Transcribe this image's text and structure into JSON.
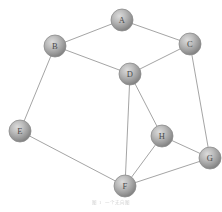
{
  "figure": {
    "caption": "图 1 一个无向图",
    "caption_legible": false,
    "caption_y": 199,
    "background_color": "#ffffff",
    "width": 222,
    "height": 212
  },
  "style": {
    "node_radius": 11,
    "node_fill_light": "#d2d2d2",
    "node_fill_mid": "#a6a6a6",
    "node_fill_dark": "#7d7d7d",
    "node_stroke": "#8c8c8c",
    "edge_color": "#9a9a9a",
    "edge_width": 0.9,
    "label_color": "#4a4a4a"
  },
  "chart_data": {
    "type": "diagram",
    "diagram_kind": "undirected-graph",
    "node_count": 8,
    "edge_count": 12,
    "nodes": [
      {
        "id": "A",
        "label": "A",
        "x": 122,
        "y": 20
      },
      {
        "id": "B",
        "label": "B",
        "x": 55,
        "y": 46
      },
      {
        "id": "C",
        "label": "C",
        "x": 190,
        "y": 44
      },
      {
        "id": "D",
        "label": "D",
        "x": 130,
        "y": 74
      },
      {
        "id": "E",
        "label": "E",
        "x": 20,
        "y": 131
      },
      {
        "id": "F",
        "label": "F",
        "x": 125,
        "y": 186
      },
      {
        "id": "G",
        "label": "G",
        "x": 210,
        "y": 158
      },
      {
        "id": "H",
        "label": "H",
        "x": 162,
        "y": 136
      }
    ],
    "edges": [
      {
        "from": "A",
        "to": "B"
      },
      {
        "from": "A",
        "to": "C"
      },
      {
        "from": "B",
        "to": "D"
      },
      {
        "from": "B",
        "to": "E"
      },
      {
        "from": "C",
        "to": "D"
      },
      {
        "from": "C",
        "to": "G"
      },
      {
        "from": "D",
        "to": "F"
      },
      {
        "from": "D",
        "to": "H"
      },
      {
        "from": "E",
        "to": "F"
      },
      {
        "from": "F",
        "to": "H"
      },
      {
        "from": "F",
        "to": "G"
      },
      {
        "from": "G",
        "to": "H"
      }
    ],
    "adjacency": {
      "A": [
        "B",
        "C"
      ],
      "B": [
        "A",
        "D",
        "E"
      ],
      "C": [
        "A",
        "D",
        "G"
      ],
      "D": [
        "B",
        "C",
        "F",
        "H"
      ],
      "E": [
        "B",
        "F"
      ],
      "F": [
        "D",
        "E",
        "H",
        "G"
      ],
      "G": [
        "C",
        "F",
        "H"
      ],
      "H": [
        "D",
        "F",
        "G"
      ]
    }
  }
}
